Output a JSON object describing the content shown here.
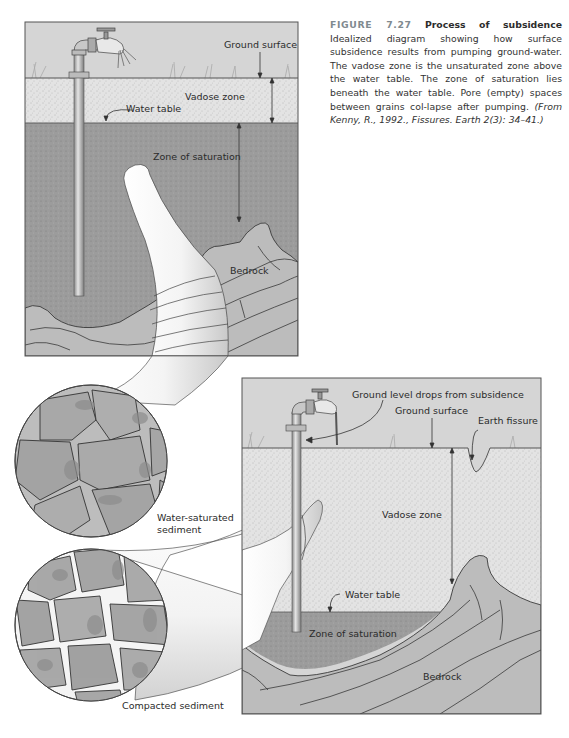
{
  "caption": {
    "figure_number": "FIGURE 7.27",
    "title": "Process of subsidence",
    "body": "Idealized diagram showing how surface subsidence results from pumping ground-water. The vadose zone is the unsaturated zone above the water table. The zone of saturation lies beneath the water table. Pore (empty) spaces between grains col-lapse after pumping.",
    "source": "(From Kenny, R., 1992., Fissures. Earth 2(3): 34–41.)"
  },
  "top_panel": {
    "labels": {
      "ground_surface": "Ground surface",
      "vadose_zone": "Vadose zone",
      "water_table": "Water table",
      "zone_of_saturation": "Zone of saturation",
      "bedrock": "Bedrock"
    }
  },
  "bottom_panel": {
    "labels": {
      "ground_level_drops": "Ground level drops from subsidence",
      "ground_surface": "Ground surface",
      "earth_fissure": "Earth fissure",
      "vadose_zone": "Vadose zone",
      "water_table": "Water table",
      "zone_of_saturation": "Zone of saturation",
      "bedrock": "Bedrock"
    }
  },
  "insets": {
    "water_saturated": {
      "line1": "Water-saturated",
      "line2": "sediment"
    },
    "compacted": "Compacted sediment"
  },
  "colors": {
    "sky": "#d6d6d6",
    "vadose": "#e2e2e2",
    "saturation": "#9a9a9a",
    "bedrock": "#bdbdbd",
    "grain": "#a9a9a9",
    "grain_shadow": "#8c8c8c",
    "horn": "#f2f2f2",
    "caption_figure_number": "#7f8a90"
  }
}
